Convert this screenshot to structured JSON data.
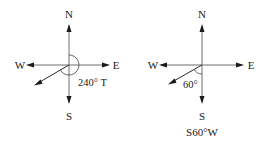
{
  "diagrams": [
    {
      "name": "true-bearing",
      "compass": {
        "north": "N",
        "south": "S",
        "east": "E",
        "west": "W"
      },
      "angle_label": "240° T",
      "caption": ""
    },
    {
      "name": "quadrant-bearing",
      "compass": {
        "north": "N",
        "south": "S",
        "east": "E",
        "west": "W"
      },
      "angle_label": "60°",
      "caption": "S60°W"
    }
  ]
}
